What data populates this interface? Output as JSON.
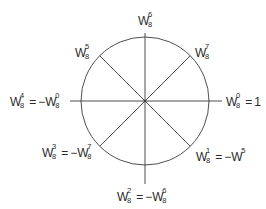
{
  "diagram": {
    "type": "unit-circle-twiddle-factors",
    "colors": {
      "stroke": "#3a3a3a",
      "text": "#2a2a2a",
      "background": "#ffffff"
    },
    "labels": {
      "top": {
        "base": "W",
        "sup": "6",
        "sub": "8"
      },
      "top_left": {
        "base": "W",
        "sup": "5",
        "sub": "8"
      },
      "top_right": {
        "base": "W",
        "sup": "7",
        "sub": "8"
      },
      "left": {
        "lhs": {
          "base": "W",
          "sup": "4",
          "sub": "8"
        },
        "eq": "=",
        "rhs_prefix": "−",
        "rhs": {
          "base": "W",
          "sup": "0",
          "sub": "8"
        }
      },
      "right": {
        "lhs": {
          "base": "W",
          "sup": "0",
          "sub": "8"
        },
        "eq": "=",
        "rhs_text": "1"
      },
      "bottom_left": {
        "lhs": {
          "base": "W",
          "sup": "3",
          "sub": "8"
        },
        "eq": "=",
        "rhs_prefix": "−",
        "rhs": {
          "base": "W",
          "sup": "7",
          "sub": "8"
        }
      },
      "bottom_right": {
        "lhs": {
          "base": "W",
          "sup": "1",
          "sub": "8"
        },
        "eq": "=",
        "rhs_prefix": "−",
        "rhs": {
          "base": "W",
          "sup": "5",
          "sub": ""
        }
      },
      "bottom": {
        "lhs": {
          "base": "W",
          "sup": "2",
          "sub": "8"
        },
        "eq": "=",
        "rhs_prefix": "−",
        "rhs": {
          "base": "W",
          "sup": "6",
          "sub": "8"
        }
      }
    }
  }
}
